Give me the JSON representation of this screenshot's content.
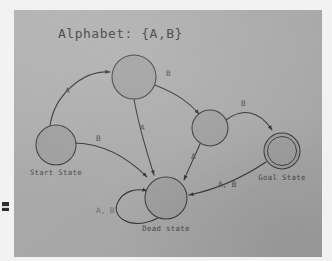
{
  "figure": {
    "kind": "finite-state-machine-diagram",
    "title": "Alphabet: {A,B}",
    "paper_color": "#a9a9a9",
    "ink_color": "#333333",
    "state_fill": "#9d9d9d"
  },
  "states": [
    {
      "id": "start",
      "label": "Start State",
      "shape": "circle",
      "cx": 42,
      "cy": 135,
      "r": 20
    },
    {
      "id": "top",
      "label": "",
      "shape": "circle",
      "cx": 120,
      "cy": 67,
      "r": 22
    },
    {
      "id": "right",
      "label": "",
      "shape": "circle",
      "cx": 196,
      "cy": 118,
      "r": 18
    },
    {
      "id": "goal",
      "label": "Goal State",
      "shape": "double-circle",
      "cx": 268,
      "cy": 141,
      "r": 18
    },
    {
      "id": "dead",
      "label": "Dead state",
      "shape": "circle",
      "cx": 152,
      "cy": 188,
      "r": 21
    }
  ],
  "transitions": [
    {
      "id": "t1",
      "from": "start",
      "to": "top",
      "symbol": "A",
      "label_x": 65,
      "label_y": 92
    },
    {
      "id": "t2",
      "from": "start",
      "to": "dead",
      "symbol": "B",
      "label_x": 95,
      "label_y": 140
    },
    {
      "id": "t3",
      "from": "top",
      "to": "right",
      "symbol": "B",
      "label_x": 165,
      "label_y": 73
    },
    {
      "id": "t4",
      "from": "top",
      "to": "dead",
      "symbol": "A",
      "label_x": 137,
      "label_y": 126
    },
    {
      "id": "t5",
      "from": "right",
      "to": "goal",
      "symbol": "B",
      "label_x": 240,
      "label_y": 104
    },
    {
      "id": "t6",
      "from": "right",
      "to": "dead",
      "symbol": "A",
      "label_x": 188,
      "label_y": 155
    },
    {
      "id": "t7",
      "from": "goal",
      "to": "dead",
      "symbol": "A, B",
      "label_x": 222,
      "label_y": 183
    },
    {
      "id": "t8",
      "from": "dead",
      "to": "dead",
      "symbol": "A, B",
      "label_x": 97,
      "label_y": 210
    }
  ],
  "labels": {
    "start_state": "Start State",
    "goal_state": "Goal State",
    "dead_state": "Dead state"
  }
}
